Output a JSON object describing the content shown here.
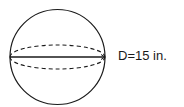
{
  "diagram": {
    "shape": "sphere",
    "diameter_label": "D=15 in.",
    "diameter_value": 15,
    "diameter_unit": "in.",
    "stroke_color": "#1a1a1a"
  }
}
